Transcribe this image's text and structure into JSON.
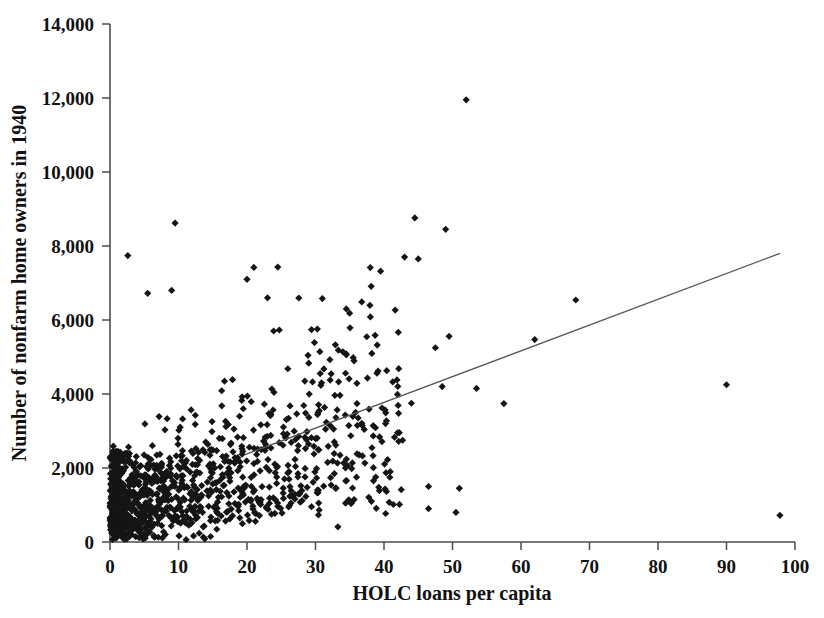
{
  "chart_data": {
    "type": "scatter",
    "title": "",
    "xlabel": "HOLC loans per capita",
    "ylabel": "Number of nonfarm home owners in 1940",
    "xlim": [
      0,
      100
    ],
    "ylim": [
      0,
      14000
    ],
    "xticks": [
      0,
      10,
      20,
      30,
      40,
      50,
      60,
      70,
      80,
      90,
      100
    ],
    "yticks": [
      0,
      2000,
      4000,
      6000,
      8000,
      10000,
      12000,
      14000
    ],
    "xtick_labels": [
      "0",
      "10",
      "20",
      "30",
      "40",
      "50",
      "60",
      "70",
      "80",
      "90",
      "100"
    ],
    "ytick_labels": [
      "0",
      "2,000",
      "4,000",
      "6,000",
      "8,000",
      "10,000",
      "12,000",
      "14,000"
    ],
    "grid": false,
    "legend": false,
    "marker": "diamond",
    "marker_color": "#151515",
    "marker_size": 6,
    "trend_line": {
      "type": "linear-fit",
      "color": "#555555",
      "x_start": 19.7,
      "y_start": 2360,
      "x_end": 97.8,
      "y_end": 7800,
      "slope": 69.7,
      "intercept": 987
    },
    "n_points": 1180,
    "notable_points": [
      {
        "x": 52.0,
        "y": 11950,
        "note": "highest outlier"
      },
      {
        "x": 44.5,
        "y": 8760
      },
      {
        "x": 49.0,
        "y": 8450
      },
      {
        "x": 9.5,
        "y": 8620
      },
      {
        "x": 43.0,
        "y": 7700
      },
      {
        "x": 45.0,
        "y": 7650
      },
      {
        "x": 2.6,
        "y": 7740
      },
      {
        "x": 21.0,
        "y": 7420
      },
      {
        "x": 24.5,
        "y": 7430
      },
      {
        "x": 39.5,
        "y": 7320
      },
      {
        "x": 20.0,
        "y": 7100
      },
      {
        "x": 68.0,
        "y": 6540
      },
      {
        "x": 5.5,
        "y": 6720
      },
      {
        "x": 9.0,
        "y": 6800
      },
      {
        "x": 23.0,
        "y": 6600
      },
      {
        "x": 31.0,
        "y": 6580
      },
      {
        "x": 34.5,
        "y": 6300
      },
      {
        "x": 62.0,
        "y": 5470
      },
      {
        "x": 57.5,
        "y": 3740
      },
      {
        "x": 90.0,
        "y": 4250,
        "note": "far-right outlier"
      },
      {
        "x": 97.8,
        "y": 720,
        "note": "far-right low outlier"
      },
      {
        "x": 49.5,
        "y": 5560
      },
      {
        "x": 47.5,
        "y": 5250
      },
      {
        "x": 53.5,
        "y": 4150
      },
      {
        "x": 48.5,
        "y": 4200
      },
      {
        "x": 44.0,
        "y": 3750
      },
      {
        "x": 51.0,
        "y": 1450
      },
      {
        "x": 46.5,
        "y": 1500
      },
      {
        "x": 46.5,
        "y": 900
      },
      {
        "x": 50.5,
        "y": 800
      }
    ],
    "density_description": "Dense dark mass of points for x between 0 and 15 with y from 0 to 3,000; scatter fans out and thins toward higher x"
  }
}
